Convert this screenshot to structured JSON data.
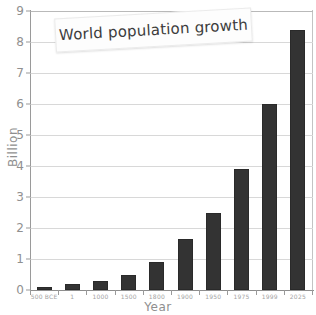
{
  "chart_data": {
    "type": "bar",
    "title": "World population growth",
    "xlabel": "Year",
    "ylabel": "Billion",
    "categories": [
      "500 BCE",
      "1",
      "1000",
      "1500",
      "1800",
      "1900",
      "1950",
      "1975",
      "1999",
      "2025"
    ],
    "values": [
      0.1,
      0.2,
      0.3,
      0.5,
      0.9,
      1.65,
      2.5,
      3.9,
      6.0,
      8.4
    ],
    "ylim": [
      0,
      9
    ],
    "yticks": [
      0,
      1,
      2,
      3,
      4,
      5,
      6,
      7,
      8,
      9
    ],
    "ytick_labels": [
      "0",
      "1",
      "2",
      "3",
      "4",
      "5",
      "6",
      "7",
      "8",
      "9"
    ],
    "grid": true,
    "legend": false,
    "bar_color": "#333333",
    "grid_color": "#d8d8d8",
    "axis_color": "#9a9a9a",
    "tick_label_color": "#909090"
  },
  "annotations": {
    "top_clipped_text": ""
  }
}
